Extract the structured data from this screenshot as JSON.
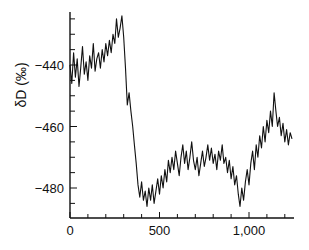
{
  "chart_data": {
    "type": "line",
    "title": "",
    "xlabel": "",
    "ylabel": "δD (‰)",
    "xlim": [
      0,
      1250
    ],
    "ylim": [
      -490,
      -418
    ],
    "grid": false,
    "legend": null,
    "x_ticks": [
      0,
      500,
      1000
    ],
    "x_tick_labels": [
      "0",
      "500",
      "1,000"
    ],
    "x_minor_step": 100,
    "y_ticks": [
      -440,
      -460,
      -480
    ],
    "y_tick_labels": [
      "−440",
      "−460",
      "−480"
    ],
    "y_minor_step": 5,
    "series": [
      {
        "name": "δD",
        "color": "#111111",
        "x": [
          0,
          10,
          20,
          30,
          40,
          50,
          60,
          70,
          80,
          90,
          100,
          110,
          120,
          130,
          140,
          150,
          160,
          170,
          180,
          190,
          200,
          210,
          220,
          230,
          240,
          250,
          260,
          270,
          280,
          290,
          300,
          310,
          320,
          330,
          340,
          350,
          360,
          370,
          380,
          390,
          400,
          410,
          420,
          430,
          440,
          450,
          460,
          470,
          480,
          490,
          500,
          510,
          520,
          530,
          540,
          550,
          560,
          570,
          580,
          590,
          600,
          610,
          620,
          630,
          640,
          650,
          660,
          670,
          680,
          690,
          700,
          710,
          720,
          730,
          740,
          750,
          760,
          770,
          780,
          790,
          800,
          810,
          820,
          830,
          840,
          850,
          860,
          870,
          880,
          890,
          900,
          910,
          920,
          930,
          940,
          950,
          960,
          970,
          980,
          990,
          1000,
          1010,
          1020,
          1030,
          1040,
          1050,
          1060,
          1070,
          1080,
          1090,
          1100,
          1110,
          1120,
          1130,
          1140,
          1150,
          1160,
          1170,
          1180,
          1190,
          1200,
          1210,
          1220,
          1230,
          1240
        ],
        "y": [
          -440,
          -446,
          -436,
          -444,
          -438,
          -447,
          -441,
          -434,
          -443,
          -439,
          -445,
          -437,
          -441,
          -433,
          -442,
          -438,
          -436,
          -441,
          -435,
          -439,
          -433,
          -437,
          -432,
          -436,
          -430,
          -433,
          -425,
          -431,
          -428,
          -424,
          -431,
          -441,
          -453,
          -449,
          -455,
          -460,
          -466,
          -472,
          -479,
          -483,
          -478,
          -484,
          -481,
          -486,
          -480,
          -484,
          -479,
          -485,
          -481,
          -477,
          -482,
          -476,
          -480,
          -474,
          -478,
          -471,
          -475,
          -470,
          -474,
          -468,
          -472,
          -476,
          -470,
          -466,
          -472,
          -468,
          -474,
          -470,
          -465,
          -471,
          -474,
          -470,
          -476,
          -472,
          -468,
          -473,
          -470,
          -466,
          -471,
          -467,
          -472,
          -469,
          -474,
          -468,
          -471,
          -466,
          -472,
          -470,
          -475,
          -471,
          -477,
          -473,
          -479,
          -476,
          -482,
          -486,
          -480,
          -484,
          -478,
          -474,
          -479,
          -472,
          -468,
          -474,
          -466,
          -470,
          -463,
          -467,
          -460,
          -465,
          -458,
          -462,
          -455,
          -460,
          -449,
          -455,
          -460,
          -457,
          -463,
          -459,
          -465,
          -461,
          -466,
          -462,
          -464
        ]
      }
    ]
  }
}
